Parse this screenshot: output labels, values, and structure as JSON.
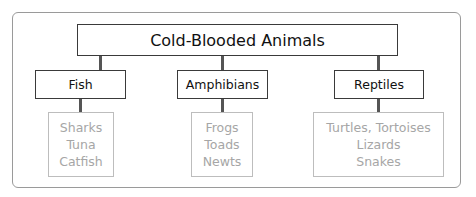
{
  "diagram": {
    "title": "Cold-Blooded Animals",
    "categories": [
      {
        "label": "Fish",
        "items": [
          "Sharks",
          "Tuna",
          "Catfish"
        ]
      },
      {
        "label": "Amphibians",
        "items": [
          "Frogs",
          "Toads",
          "Newts"
        ]
      },
      {
        "label": "Reptiles",
        "items": [
          "Turtles, Tortoises",
          "Lizards",
          "Snakes"
        ]
      }
    ]
  },
  "colors": {
    "category_border": "#3a3a3a",
    "list_border": "#bdbdbd",
    "list_text": "#a6a6a6",
    "connector": "#555555",
    "frame_border": "#9a9a9a"
  }
}
